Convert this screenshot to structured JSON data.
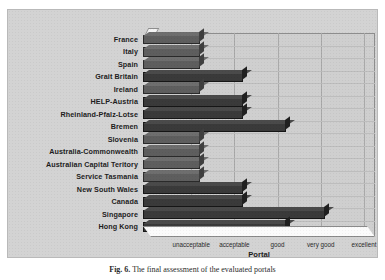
{
  "figure": {
    "caption_label": "Fig. 6.",
    "caption_text": "The final assessment of the evaluated portals"
  },
  "chart_data": {
    "type": "bar",
    "orientation": "horizontal",
    "title": "",
    "xlabel": "Portal",
    "ylabel": "",
    "grid": true,
    "legend": null,
    "xlim": [
      0,
      5
    ],
    "xtick_labels": [
      "unacceptable",
      "acceptable",
      "good",
      "very good",
      "excellent"
    ],
    "xtick_values": [
      1,
      2,
      3,
      4,
      5
    ],
    "categories": [
      "France",
      "Italy",
      "Spain",
      "Grait Britain",
      "Ireland",
      "HELP-Austria",
      "Rheinland-Pfalz-Lotse",
      "Bremen",
      "Slovenia",
      "Australia-Commonwealth",
      "Australian Capital Teritory",
      "Service Tasmania",
      "New South Wales",
      "Canada",
      "Singapore",
      "Hong Kong"
    ],
    "values": [
      1.2,
      1.2,
      1.2,
      2.2,
      1.2,
      2.2,
      2.2,
      3.2,
      1.2,
      1.2,
      1.2,
      1.2,
      2.2,
      2.2,
      4.1,
      3.2
    ],
    "shades": [
      "light",
      "light",
      "light",
      "dark",
      "light",
      "dark",
      "dark",
      "dark",
      "light",
      "light",
      "light",
      "light",
      "dark",
      "dark",
      "dark",
      "dark"
    ],
    "colors": {
      "bar_dark": "#3a3a3a",
      "bar_light": "#5e5e5e",
      "panel_background": "#d3d3d3",
      "plot_background": "#cfcfcf",
      "gridline": "#a9a9a9",
      "text": "#1d1d1d"
    }
  }
}
